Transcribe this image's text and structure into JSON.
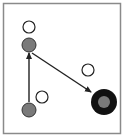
{
  "diagram": {
    "frame": {
      "x": 3.5,
      "y": 3.5,
      "width": 117,
      "height": 130,
      "stroke": "#8a8a8a"
    },
    "colors": {
      "background": "#ffffff",
      "empty_node_stroke": "#222222",
      "filled_node": "#7a7a7a",
      "target_outer": "#111111",
      "arrow": "#222222"
    },
    "nodes": [
      {
        "id": "empty-top",
        "kind": "empty",
        "cx": 29,
        "cy": 27,
        "r": 6
      },
      {
        "id": "gray-mid",
        "kind": "filled",
        "cx": 29,
        "cy": 45,
        "r": 7
      },
      {
        "id": "gray-bottom",
        "kind": "filled",
        "cx": 29,
        "cy": 110,
        "r": 7
      },
      {
        "id": "empty-bottom",
        "kind": "empty",
        "cx": 42,
        "cy": 97,
        "r": 6
      },
      {
        "id": "empty-right",
        "kind": "empty",
        "cx": 88,
        "cy": 70,
        "r": 6
      },
      {
        "id": "target",
        "kind": "target",
        "cx": 104,
        "cy": 102,
        "r": 13,
        "inner_r": 6
      }
    ],
    "arrows": [
      {
        "id": "arrow-up",
        "from": "gray-bottom",
        "to": "gray-mid",
        "x1": 29,
        "y1": 102,
        "x2": 29,
        "y2": 53
      },
      {
        "id": "arrow-diagonal",
        "from": "gray-mid",
        "to": "target",
        "x1": 32,
        "y1": 53,
        "x2": 91,
        "y2": 92
      }
    ]
  }
}
